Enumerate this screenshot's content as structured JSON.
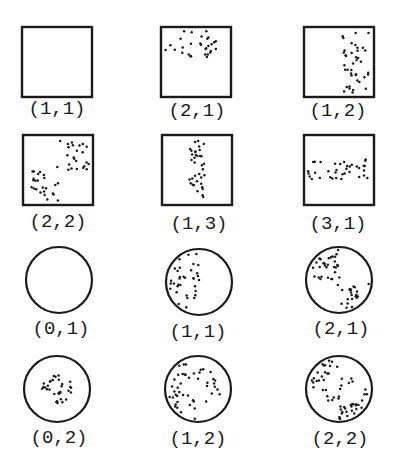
{
  "diagram": {
    "title": "",
    "colors": {
      "stroke": "#1a1a1a",
      "dot": "#1a1a1a",
      "background": "#ffffff"
    },
    "panels": [
      {
        "id": "sq-1-1",
        "shape": "square",
        "label": "(1,1)",
        "cx": 57,
        "cy": 62,
        "size": 70,
        "labelX": 57,
        "labelY": 98,
        "region": "none"
      },
      {
        "id": "sq-2-1",
        "shape": "square",
        "label": "(2,1)",
        "cx": 196,
        "cy": 62,
        "size": 70,
        "labelX": 197,
        "labelY": 100,
        "region": "top-half"
      },
      {
        "id": "sq-1-2",
        "shape": "square",
        "label": "(1,2)",
        "cx": 339,
        "cy": 62,
        "size": 70,
        "labelX": 338,
        "labelY": 100,
        "region": "right-half"
      },
      {
        "id": "sq-2-2",
        "shape": "square",
        "label": "(2,2)",
        "cx": 58,
        "cy": 170,
        "size": 70,
        "labelX": 58,
        "labelY": 211,
        "region": "checker-diagonal"
      },
      {
        "id": "sq-1-3",
        "shape": "square",
        "label": "(1,3)",
        "cx": 197,
        "cy": 170,
        "size": 70,
        "labelX": 199,
        "labelY": 213,
        "region": "center-vertical-band"
      },
      {
        "id": "sq-3-1",
        "shape": "square",
        "label": "(3,1)",
        "cx": 339,
        "cy": 170,
        "size": 70,
        "labelX": 338,
        "labelY": 213,
        "region": "center-horizontal-band"
      },
      {
        "id": "ci-0-1",
        "shape": "circle",
        "label": "(0,1)",
        "cx": 59,
        "cy": 280,
        "r": 33,
        "labelX": 61,
        "labelY": 318,
        "region": "none"
      },
      {
        "id": "ci-1-1",
        "shape": "circle",
        "label": "(1,1)",
        "cx": 199,
        "cy": 282,
        "r": 33,
        "labelX": 198,
        "labelY": 321,
        "region": "left-half"
      },
      {
        "id": "ci-2-1",
        "shape": "circle",
        "label": "(2,1)",
        "cx": 339,
        "cy": 280,
        "r": 33,
        "labelX": 341,
        "labelY": 318,
        "region": "two-opposite-quadrants"
      },
      {
        "id": "ci-0-2",
        "shape": "circle",
        "label": "(0,2)",
        "cx": 57,
        "cy": 389,
        "r": 33,
        "labelX": 59,
        "labelY": 427,
        "region": "inner-disk"
      },
      {
        "id": "ci-1-2",
        "shape": "circle",
        "label": "(1,2)",
        "cx": 198,
        "cy": 389,
        "r": 33,
        "labelX": 198,
        "labelY": 428,
        "region": "outer-ring-half"
      },
      {
        "id": "ci-2-2",
        "shape": "circle",
        "label": "(2,2)",
        "cx": 339,
        "cy": 389,
        "r": 33,
        "labelX": 340,
        "labelY": 428,
        "region": "ring-quadrants"
      }
    ]
  }
}
